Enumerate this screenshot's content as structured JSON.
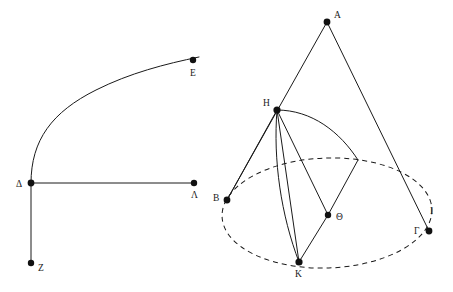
{
  "figure": {
    "background_color": "#ffffff",
    "line_color": "#1a1a1a",
    "dot_color": "#111111",
    "canvas": {
      "width": 453,
      "height": 292
    }
  },
  "left_figure": {
    "name": "curve-with-axes",
    "points": [
      {
        "id": "E",
        "label": "E",
        "x": 193,
        "y": 60,
        "label_x": 190,
        "label_y": 76,
        "dot": true
      },
      {
        "id": "D",
        "label": "Δ",
        "x": 31,
        "y": 183,
        "label_x": 16,
        "label_y": 187,
        "dot": true
      },
      {
        "id": "L",
        "label": "Λ",
        "x": 194,
        "y": 183,
        "label_x": 191,
        "label_y": 198,
        "dot": true
      },
      {
        "id": "Z",
        "label": "Z",
        "x": 31,
        "y": 263,
        "label_x": 38,
        "label_y": 271,
        "dot": true
      }
    ],
    "segments": [
      {
        "id": "delta-lambda",
        "from": "D",
        "to": "L",
        "style": "solid"
      },
      {
        "id": "delta-zeta",
        "from": "D",
        "to": "Z",
        "style": "solid"
      }
    ],
    "curves": [
      {
        "id": "curve-delta-epsilon",
        "label": "parabola-like arc from Δ to E",
        "style": "solid",
        "path": "M 31 183 C 31 140 52 112 96 90 C 130 73 165 64 199 57"
      }
    ]
  },
  "right_figure": {
    "name": "cone-with-ellipse-base",
    "points": [
      {
        "id": "A",
        "label": "A",
        "x": 327,
        "y": 22,
        "label_x": 334,
        "label_y": 18,
        "dot": true
      },
      {
        "id": "H",
        "label": "H",
        "x": 277,
        "y": 110,
        "label_x": 263,
        "label_y": 106,
        "dot": true
      },
      {
        "id": "B",
        "label": "B",
        "x": 227,
        "y": 200,
        "label_x": 213,
        "label_y": 201,
        "dot": true
      },
      {
        "id": "Th",
        "label": "Θ",
        "x": 328,
        "y": 215,
        "label_x": 336,
        "label_y": 220,
        "dot": true
      },
      {
        "id": "G",
        "label": "Γ",
        "x": 429,
        "y": 231,
        "label_x": 414,
        "label_y": 234,
        "dot": true
      },
      {
        "id": "K",
        "label": "K",
        "x": 299,
        "y": 262,
        "label_x": 295,
        "label_y": 277,
        "dot": true
      },
      {
        "id": "I",
        "label": "I",
        "x": 358,
        "y": 160,
        "label_x": 430,
        "label_y": 214,
        "dot": false
      }
    ],
    "ellipse": {
      "id": "base-circle",
      "style": "dashed",
      "cx": 327,
      "cy": 213,
      "rx": 105,
      "ry": 55,
      "rotation": -2
    },
    "segments": [
      {
        "id": "A-B",
        "from": "A",
        "to": "B",
        "style": "solid"
      },
      {
        "id": "A-G",
        "from": "A",
        "to": "G",
        "style": "solid"
      },
      {
        "id": "H-B",
        "from": "H",
        "to": "B",
        "style": "solid"
      },
      {
        "id": "H-K",
        "from": "H",
        "to": "K",
        "style": "solid"
      },
      {
        "id": "H-Th",
        "from": "H",
        "to": "Th",
        "style": "solid"
      },
      {
        "id": "Th-K",
        "from": "Th",
        "to": "K",
        "style": "solid"
      },
      {
        "id": "Th-I",
        "from": "Th",
        "to": "I",
        "style": "solid"
      }
    ],
    "curves": [
      {
        "id": "arc-H-K",
        "label": "curve from H down to K",
        "style": "solid",
        "path": "M 277 110 C 273 160 281 215 299 262"
      },
      {
        "id": "arc-H-I",
        "label": "section curve from H to point I on rim",
        "style": "solid",
        "path": "M 277 110 C 312 110 340 132 358 160"
      }
    ]
  }
}
